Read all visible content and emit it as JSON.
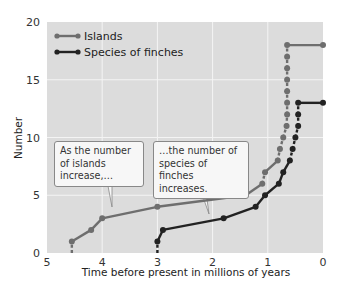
{
  "chart_data": {
    "type": "line",
    "title": "",
    "xlabel": "Time before present in millions of years",
    "ylabel": "Number",
    "xlim": [
      5,
      0
    ],
    "ylim": [
      0,
      20
    ],
    "x_ticks": [
      "5",
      "4",
      "3",
      "2",
      "1",
      "0"
    ],
    "y_ticks": [
      "0",
      "5",
      "10",
      "15",
      "20"
    ],
    "grid": true,
    "legend_position": "upper-left",
    "series": [
      {
        "name": "Islands",
        "color": "#6e6e6e",
        "points": [
          [
            4.55,
            0
          ],
          [
            4.55,
            1
          ],
          [
            4.2,
            2
          ],
          [
            4.0,
            3
          ],
          [
            3.0,
            4
          ],
          [
            1.4,
            5
          ],
          [
            1.1,
            6
          ],
          [
            1.05,
            7
          ],
          [
            0.82,
            8
          ],
          [
            0.78,
            9
          ],
          [
            0.72,
            10
          ],
          [
            0.66,
            11
          ],
          [
            0.65,
            12
          ],
          [
            0.65,
            13
          ],
          [
            0.65,
            14
          ],
          [
            0.65,
            15
          ],
          [
            0.65,
            16
          ],
          [
            0.65,
            17
          ],
          [
            0.65,
            18
          ],
          [
            0.0,
            18
          ]
        ]
      },
      {
        "name": "Species of finches",
        "color": "#222222",
        "points": [
          [
            3.0,
            0
          ],
          [
            3.0,
            1
          ],
          [
            2.9,
            2
          ],
          [
            1.8,
            3
          ],
          [
            1.22,
            4
          ],
          [
            1.05,
            5
          ],
          [
            0.8,
            6
          ],
          [
            0.72,
            7
          ],
          [
            0.6,
            8
          ],
          [
            0.55,
            9
          ],
          [
            0.5,
            10
          ],
          [
            0.45,
            11
          ],
          [
            0.45,
            12
          ],
          [
            0.45,
            13
          ],
          [
            0.0,
            13
          ]
        ]
      }
    ],
    "annotations": [
      {
        "text": "As the number of islands increase,…",
        "points_to": "Islands"
      },
      {
        "text": "…the number of species of finches increases.",
        "points_to": "Species of finches"
      }
    ]
  },
  "legend": {
    "items": [
      {
        "label": "Islands",
        "color": "#6e6e6e"
      },
      {
        "label": "Species of finches",
        "color": "#222222"
      }
    ]
  },
  "axes": {
    "xlabel": "Time before present in millions of years",
    "ylabel": "Number"
  },
  "callouts": {
    "islands": "As the number of islands increase,…",
    "finches": "…the number of species of finches increases."
  }
}
